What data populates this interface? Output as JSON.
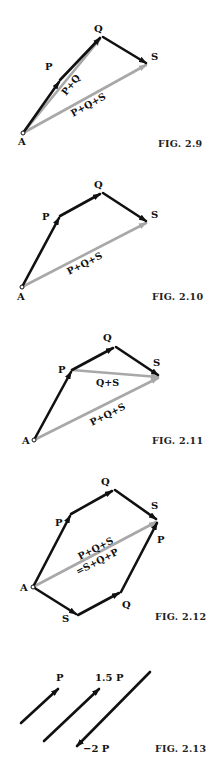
{
  "figures": [
    {
      "caption": "FIG. 2.9",
      "labels": {
        "A": "A",
        "P": "P",
        "Q": "Q",
        "S": "S"
      },
      "sums": [
        "P+Q",
        "P+Q+S"
      ]
    },
    {
      "caption": "FIG. 2.10",
      "labels": {
        "A": "A",
        "P": "P",
        "Q": "Q",
        "S": "S"
      },
      "sums": [
        "P+Q+S"
      ]
    },
    {
      "caption": "FIG. 2.11",
      "labels": {
        "A": "A",
        "P": "P",
        "Q": "Q",
        "S": "S"
      },
      "sums": [
        "Q+S",
        "P+Q+S"
      ]
    },
    {
      "caption": "FIG. 2.12",
      "labels": {
        "A": "A",
        "P_upper": "P",
        "Q_upper": "Q",
        "S_upper": "S",
        "P_lower": "P",
        "Q_lower": "Q",
        "S_lower": "S"
      },
      "sums": [
        "P+Q+S",
        "=S+Q+P"
      ]
    },
    {
      "caption": "FIG. 2.13",
      "labels": {
        "P": "P",
        "P15": "1.5 P",
        "Pm2": "−2 P"
      }
    }
  ],
  "colors": {
    "vector": "#111111",
    "resultant": "#a8a8a8"
  }
}
